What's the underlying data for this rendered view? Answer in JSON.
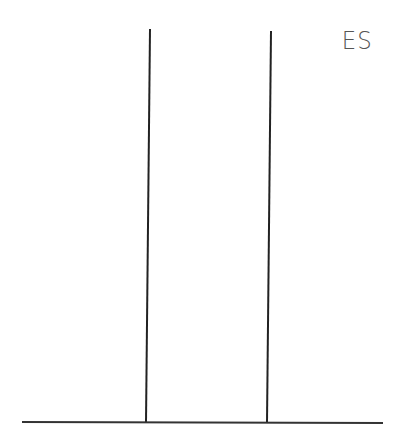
{
  "sketch": {
    "label": "ES",
    "line_color": "#222222",
    "vertical_lines": [
      {
        "x1": 150,
        "y1": 29,
        "x2": 146,
        "y2": 422
      },
      {
        "x1": 271,
        "y1": 31,
        "x2": 267,
        "y2": 422
      }
    ],
    "baseline": {
      "x1": 22,
      "y1": 422,
      "x2": 383,
      "y2": 423
    }
  }
}
